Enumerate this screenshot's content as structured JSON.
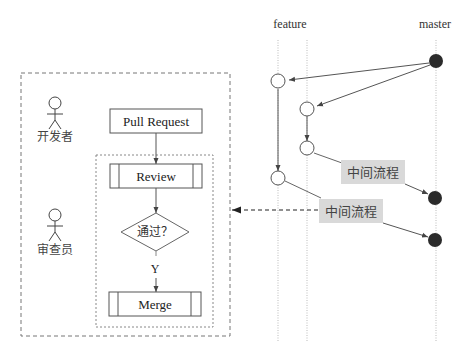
{
  "diagram": {
    "left_panel": {
      "actors": [
        {
          "id": "developer",
          "label": "开发者"
        },
        {
          "id": "reviewer",
          "label": "审查员"
        }
      ],
      "flow": {
        "pull_request": "Pull Request",
        "review": "Review",
        "decision": "通过？",
        "yes_label": "Y",
        "merge": "Merge"
      }
    },
    "right_panel": {
      "branches": [
        {
          "id": "feature",
          "label": "feature"
        },
        {
          "id": "master",
          "label": "master"
        }
      ],
      "intermediate_labels": [
        "中间流程",
        "中间流程"
      ]
    },
    "colors": {
      "line": "#555555",
      "node_filled": "#2b2b2b",
      "label_bg": "#d9d9d9",
      "guide": "#bbbbbb"
    }
  }
}
